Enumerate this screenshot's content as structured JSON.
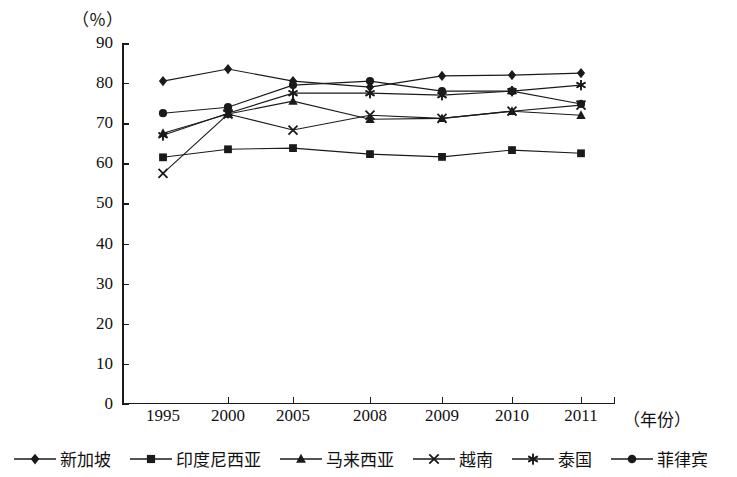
{
  "axes": {
    "y_unit_label": "（％）",
    "x_unit_label": "（年份）",
    "y_ticks": [
      "0",
      "10",
      "20",
      "30",
      "40",
      "50",
      "60",
      "70",
      "80",
      "90"
    ],
    "x_ticks": [
      "1995",
      "2000",
      "2005",
      "2008",
      "2009",
      "2010",
      "2011"
    ]
  },
  "legend": {
    "items": [
      {
        "label": "新加坡",
        "marker": "diamond-marker"
      },
      {
        "label": "印度尼西亚",
        "marker": "square-marker"
      },
      {
        "label": "马来西亚",
        "marker": "triangle-marker"
      },
      {
        "label": "越南",
        "marker": "cross-x-marker"
      },
      {
        "label": "泰国",
        "marker": "asterisk-marker"
      },
      {
        "label": "菲律宾",
        "marker": "circle-marker"
      }
    ]
  },
  "chart_data": {
    "type": "line",
    "title": "",
    "xlabel": "（年份）",
    "ylabel": "（％）",
    "ylim": [
      0,
      90
    ],
    "ytick_step": 10,
    "grid": false,
    "legend_position": "bottom",
    "categories": [
      "1995",
      "2000",
      "2005",
      "2008",
      "2009",
      "2010",
      "2011"
    ],
    "series": [
      {
        "name": "新加坡",
        "marker": "diamond",
        "values": [
          80.5,
          83.5,
          80.5,
          79.0,
          81.8,
          82.0,
          82.5
        ]
      },
      {
        "name": "印度尼西亚",
        "marker": "square",
        "values": [
          61.5,
          63.5,
          63.8,
          62.3,
          61.6,
          63.3,
          62.5
        ]
      },
      {
        "name": "马来西亚",
        "marker": "triangle",
        "values": [
          67.5,
          72.3,
          75.5,
          71.0,
          71.2,
          73.0,
          72.0
        ]
      },
      {
        "name": "越南",
        "marker": "cross",
        "values": [
          57.5,
          72.3,
          68.3,
          72.0,
          71.2,
          73.0,
          74.5
        ]
      },
      {
        "name": "泰国",
        "marker": "asterisk",
        "values": [
          67.0,
          72.5,
          77.5,
          77.5,
          77.0,
          78.0,
          79.5
        ]
      },
      {
        "name": "菲律宾",
        "marker": "circle",
        "values": [
          72.5,
          74.0,
          79.5,
          80.5,
          78.0,
          78.0,
          74.8
        ]
      }
    ]
  },
  "colors": {
    "ink": "#1a1a1a",
    "background": "#ffffff"
  }
}
